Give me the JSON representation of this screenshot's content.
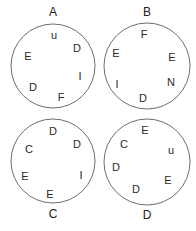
{
  "diagram": {
    "stroke_color": "#6e6e6e",
    "text_color": "#2a2a2a",
    "circles": [
      {
        "label": "A",
        "label_pos": "top",
        "cx": 53,
        "cy": 66,
        "r": 42,
        "label_x": 53,
        "label_y": 16,
        "letters": [
          {
            "ch": "u",
            "x": 54,
            "y": 39
          },
          {
            "ch": "D",
            "x": 77,
            "y": 52
          },
          {
            "ch": "E",
            "x": 28,
            "y": 60
          },
          {
            "ch": "I",
            "x": 80,
            "y": 80
          },
          {
            "ch": "D",
            "x": 33,
            "y": 91
          },
          {
            "ch": "F",
            "x": 61,
            "y": 101
          }
        ]
      },
      {
        "label": "B",
        "label_pos": "top",
        "cx": 147,
        "cy": 66,
        "r": 43,
        "label_x": 147,
        "label_y": 16,
        "letters": [
          {
            "ch": "F",
            "x": 144,
            "y": 38
          },
          {
            "ch": "E",
            "x": 116,
            "y": 57
          },
          {
            "ch": "E",
            "x": 172,
            "y": 61
          },
          {
            "ch": "N",
            "x": 171,
            "y": 86
          },
          {
            "ch": "I",
            "x": 117,
            "y": 88
          },
          {
            "ch": "D",
            "x": 143,
            "y": 102
          }
        ]
      },
      {
        "label": "C",
        "label_pos": "bottom",
        "cx": 53,
        "cy": 161,
        "r": 42,
        "label_x": 53,
        "label_y": 218,
        "letters": [
          {
            "ch": "D",
            "x": 53,
            "y": 135
          },
          {
            "ch": "D",
            "x": 77,
            "y": 148
          },
          {
            "ch": "C",
            "x": 29,
            "y": 153
          },
          {
            "ch": "I",
            "x": 81,
            "y": 179
          },
          {
            "ch": "E",
            "x": 25,
            "y": 180
          },
          {
            "ch": "E",
            "x": 50,
            "y": 198
          }
        ]
      },
      {
        "label": "D",
        "label_pos": "bottom",
        "cx": 147,
        "cy": 162,
        "r": 43,
        "label_x": 147,
        "label_y": 219,
        "letters": [
          {
            "ch": "E",
            "x": 145,
            "y": 134
          },
          {
            "ch": "C",
            "x": 124,
            "y": 148
          },
          {
            "ch": "u",
            "x": 171,
            "y": 154
          },
          {
            "ch": "D",
            "x": 116,
            "y": 171
          },
          {
            "ch": "E",
            "x": 168,
            "y": 184
          },
          {
            "ch": "D",
            "x": 136,
            "y": 193
          }
        ]
      }
    ]
  }
}
